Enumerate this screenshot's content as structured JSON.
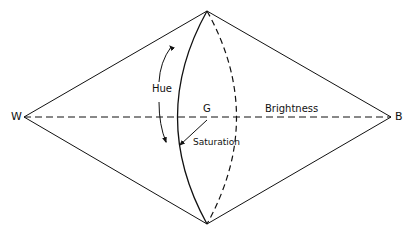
{
  "diagram": {
    "labels": {
      "white": "W",
      "black": "B",
      "gray": "G",
      "hue": "Hue",
      "brightness": "Brightness",
      "saturation": "Saturation"
    },
    "colors": {
      "stroke": "#111111",
      "background": "#ffffff"
    }
  }
}
